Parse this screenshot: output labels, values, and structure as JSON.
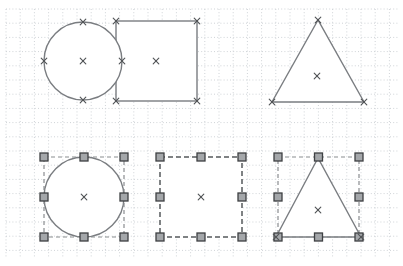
{
  "canvas": {
    "width": 403,
    "height": 266,
    "background": "#ffffff",
    "grid": {
      "spacing": 14.2,
      "left": 6,
      "top": 9,
      "right": 398,
      "bottom": 258,
      "color": "#cfd3d7",
      "dash": "1 2.2"
    },
    "marker_glyph": "×",
    "handle_size": 8,
    "colors": {
      "shape_fill": "#ffffff",
      "shape_stroke": "#7a7d81",
      "marker": "#515457",
      "handle_fill": "#a4a7aa",
      "handle_border": "#3e4043",
      "selection_dash": "#8a8d90",
      "selected_shape_dash": "#56595c"
    },
    "shapes": [
      {
        "name": "square-unselected",
        "type": "rect",
        "x": 116,
        "y": 21,
        "w": 81,
        "h": 80,
        "selected": false,
        "vertex_markers": [
          [
            116,
            21
          ],
          [
            197,
            21
          ],
          [
            116,
            101
          ],
          [
            197,
            101
          ]
        ],
        "center_marker": [
          156,
          61
        ]
      },
      {
        "name": "circle-unselected",
        "type": "circle",
        "cx": 83,
        "cy": 61,
        "r": 39,
        "selected": false,
        "vertex_markers": [
          [
            83,
            22
          ],
          [
            44,
            61
          ],
          [
            122,
            61
          ],
          [
            83,
            100
          ]
        ],
        "center_marker": [
          83,
          61
        ]
      },
      {
        "name": "triangle-unselected",
        "type": "polygon",
        "points": [
          [
            318,
            20
          ],
          [
            272,
            102
          ],
          [
            364,
            102
          ]
        ],
        "selected": false,
        "vertex_markers": [
          [
            318,
            20
          ],
          [
            272,
            102
          ],
          [
            364,
            102
          ]
        ],
        "center_marker": [
          317,
          76
        ]
      },
      {
        "name": "circle-selected",
        "type": "circle",
        "cx": 84,
        "cy": 197,
        "r": 40,
        "selected": true,
        "selection": {
          "box": [
            44,
            157,
            80,
            80
          ],
          "outline": true
        },
        "vertex_markers": [],
        "center_marker": [
          84,
          197
        ]
      },
      {
        "name": "square-selected",
        "type": "rect",
        "x": 160,
        "y": 157,
        "w": 82,
        "h": 80,
        "dashed": true,
        "selected": true,
        "selection": {
          "box": [
            160,
            157,
            82,
            80
          ],
          "outline": false
        },
        "vertex_markers": [],
        "center_marker": [
          201,
          197
        ]
      },
      {
        "name": "triangle-selected",
        "type": "polygon",
        "points": [
          [
            318,
            158
          ],
          [
            276,
            237
          ],
          [
            361,
            237
          ]
        ],
        "selected": true,
        "selection": {
          "box": [
            278,
            157,
            81,
            80
          ],
          "outline": true
        },
        "vertex_markers": [
          [
            276,
            237
          ],
          [
            361,
            237
          ]
        ],
        "center_marker": [
          318,
          210
        ]
      }
    ]
  }
}
